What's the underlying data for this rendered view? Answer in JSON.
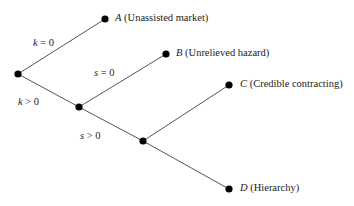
{
  "diagram": {
    "type": "decision-tree",
    "nodes": [
      {
        "id": "root",
        "x": 18,
        "y": 74
      },
      {
        "id": "n1",
        "x": 79,
        "y": 107
      },
      {
        "id": "n2",
        "x": 143,
        "y": 141
      },
      {
        "id": "A",
        "x": 105,
        "y": 19
      },
      {
        "id": "B",
        "x": 166,
        "y": 54
      },
      {
        "id": "C",
        "x": 229,
        "y": 85
      },
      {
        "id": "D",
        "x": 229,
        "y": 189
      }
    ],
    "edges": [
      {
        "from": "root",
        "to": "A",
        "label": "k = 0"
      },
      {
        "from": "root",
        "to": "n1",
        "label": "k > 0"
      },
      {
        "from": "n1",
        "to": "B",
        "label": "s = 0"
      },
      {
        "from": "n1",
        "to": "n2",
        "label": "s > 0"
      },
      {
        "from": "n2",
        "to": "C",
        "label": ""
      },
      {
        "from": "n2",
        "to": "D",
        "label": ""
      }
    ],
    "leaves": {
      "A": {
        "letter": "A",
        "desc": "(Unassisted market)"
      },
      "B": {
        "letter": "B",
        "desc": "(Unrelieved hazard)"
      },
      "C": {
        "letter": "C",
        "desc": "(Credible contracting)"
      },
      "D": {
        "letter": "D",
        "desc": "(Hierarchy)"
      }
    },
    "edge_labels": {
      "k0": {
        "var": "k",
        "rest": " = 0"
      },
      "kpos": {
        "var": "k",
        "rest": " > 0"
      },
      "s0": {
        "var": "s",
        "rest": " = 0"
      },
      "spos": {
        "var": "s",
        "rest": " > 0"
      }
    }
  }
}
